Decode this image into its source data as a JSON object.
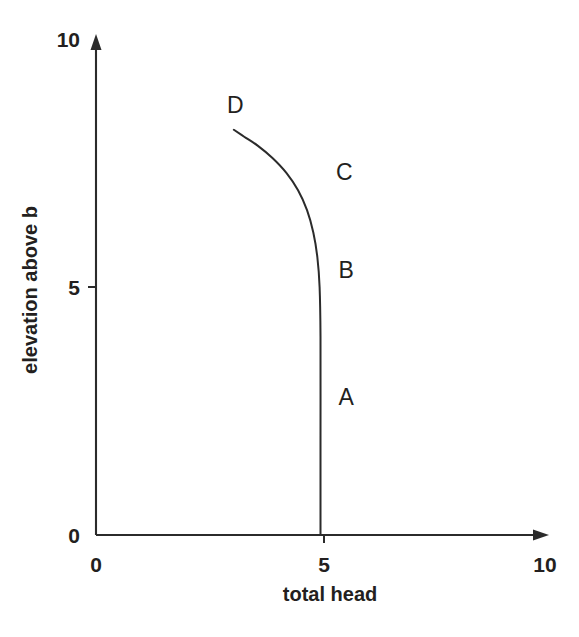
{
  "chart_data": {
    "type": "line",
    "title": "",
    "xlabel": "total head",
    "ylabel": "elevation above b",
    "xlim": [
      0,
      10
    ],
    "ylim": [
      0,
      10
    ],
    "xticks": [
      0,
      5,
      10
    ],
    "yticks": [
      0,
      5,
      10
    ],
    "xtick_labels": [
      "0",
      "5",
      "10"
    ],
    "ytick_labels": [
      "0",
      "5",
      "10"
    ],
    "grid": false,
    "legend": "none",
    "series": [
      {
        "name": "total head profile",
        "x": [
          5.0,
          5.0,
          5.0,
          4.98,
          4.93,
          4.84,
          4.7,
          4.5,
          4.24,
          3.93,
          3.6,
          3.3,
          3.07
        ],
        "y": [
          0.0,
          2.0,
          4.0,
          5.0,
          5.6,
          6.1,
          6.55,
          6.95,
          7.3,
          7.6,
          7.85,
          8.03,
          8.17
        ]
      }
    ],
    "annotations": [
      {
        "text": "D",
        "x": 3.1,
        "y": 8.5
      },
      {
        "text": "C",
        "x": 5.53,
        "y": 7.15
      },
      {
        "text": "B",
        "x": 5.57,
        "y": 5.18
      },
      {
        "text": "A",
        "x": 5.57,
        "y": 2.62
      }
    ]
  },
  "colors": {
    "ink": "#231f20",
    "axis": "#2b2b2b",
    "background": "#ffffff"
  }
}
